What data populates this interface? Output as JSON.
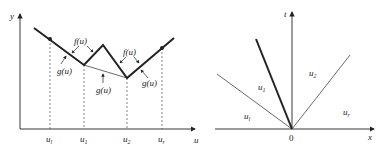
{
  "left_plot": {
    "y_axis_label": "y",
    "x_axis_label": "u",
    "ticks": [
      {
        "base": "u",
        "sub": "l"
      },
      {
        "base": "u",
        "sub": "1"
      },
      {
        "base": "u",
        "sub": "2"
      },
      {
        "base": "u",
        "sub": "r"
      }
    ],
    "annotations": {
      "f1": "f(u)",
      "g1": "g(u)",
      "g_mid": "g(u)",
      "f2": "f(u)",
      "g2": "g(u)"
    }
  },
  "right_plot": {
    "t_axis_label": "t",
    "x_axis_label": "x",
    "origin_label": "0",
    "regions": [
      {
        "base": "u",
        "sub": "l"
      },
      {
        "base": "u",
        "sub": "1"
      },
      {
        "base": "u",
        "sub": "2"
      },
      {
        "base": "u",
        "sub": "r"
      }
    ]
  },
  "colors": {
    "line": "#222222",
    "thin_line": "#444444",
    "dashed": "#555555"
  }
}
